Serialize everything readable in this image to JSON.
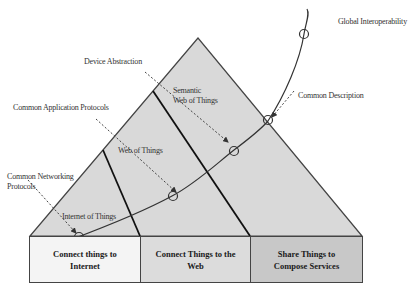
{
  "diagram": {
    "type": "pyramid-layers",
    "annotations": {
      "global_interoperability": "Global Interoperability",
      "device_abstraction": "Device Abstraction",
      "common_application_protocols": "Common Application Protocols",
      "common_networking_protocols_line1": "Common Networking",
      "common_networking_protocols_line2": "Protocols",
      "common_description": "Common Description"
    },
    "layers": {
      "internet_of_things": "Internet of Things",
      "web_of_things": "Web of Things",
      "semantic_web_of_things_line1": "Semantic",
      "semantic_web_of_things_line2": "Web of Things"
    },
    "boxes": [
      {
        "line1": "Connect things to",
        "line2": "Internet",
        "color": "#f4f4f4"
      },
      {
        "line1": "Connect Things to the",
        "line2": "Web",
        "color": "#dcdcdc"
      },
      {
        "line1": "Share Things to",
        "line2": "Compose Services",
        "color": "#c8c8c8"
      }
    ],
    "colors": {
      "pyramid_fill": "#d9d9d9",
      "outline": "#444444",
      "curve": "#333333"
    }
  }
}
